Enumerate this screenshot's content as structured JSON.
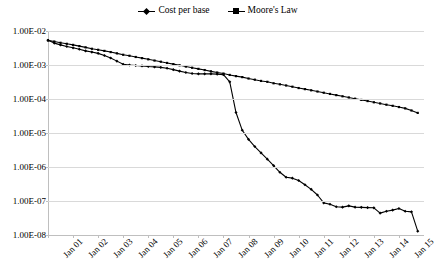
{
  "chart_data": {
    "type": "line",
    "title": "",
    "xlabel": "",
    "ylabel": "",
    "yscale": "log",
    "ylim": [
      1e-08,
      0.01
    ],
    "grid": true,
    "legend_position": "top-center",
    "ytick_labels": [
      "1.00E-02",
      "1.00E-03",
      "1.00E-04",
      "1.00E-05",
      "1.00E-06",
      "1.00E-07",
      "1.00E-08"
    ],
    "ytick_values": [
      0.01,
      0.001,
      0.0001,
      1e-05,
      1e-06,
      1e-07,
      1e-08
    ],
    "categories": [
      "Jan 01",
      "Jan 02",
      "Jan 03",
      "Jan 04",
      "Jan 05",
      "Jan 06",
      "Jan 07",
      "Jan 08",
      "Jan 09",
      "Jan 10",
      "Jan 11",
      "Jan 12",
      "Jan 13",
      "Jan 14",
      "Jan 15"
    ],
    "x": [
      2001.0,
      2002.0,
      2003.0,
      2004.0,
      2005.0,
      2006.0,
      2007.0,
      2008.0,
      2009.0,
      2010.0,
      2011.0,
      2012.0,
      2013.0,
      2014.0,
      2015.0
    ],
    "series": [
      {
        "name": "Cost per base",
        "marker": "diamond",
        "color": "#000000",
        "x": [
          2001.0,
          2001.25,
          2001.5,
          2001.75,
          2002.0,
          2002.25,
          2002.5,
          2002.75,
          2003.0,
          2003.25,
          2003.5,
          2003.75,
          2004.0,
          2004.25,
          2004.5,
          2004.75,
          2005.0,
          2005.25,
          2005.5,
          2005.75,
          2006.0,
          2006.25,
          2006.5,
          2006.75,
          2007.0,
          2007.25,
          2007.5,
          2007.75,
          2008.0,
          2008.25,
          2008.5,
          2008.75,
          2009.0,
          2009.25,
          2009.5,
          2009.75,
          2010.0,
          2010.25,
          2010.5,
          2010.75,
          2011.0,
          2011.25,
          2011.5,
          2011.75,
          2012.0,
          2012.25,
          2012.5,
          2012.75,
          2013.0,
          2013.25,
          2013.5,
          2013.75,
          2014.0,
          2014.25,
          2014.5,
          2014.75,
          2015.0,
          2015.25,
          2015.5,
          2015.75
        ],
        "values": [
          0.0053,
          0.0044,
          0.0039,
          0.0035,
          0.0032,
          0.0029,
          0.0026,
          0.0024,
          0.0022,
          0.0019,
          0.0016,
          0.0013,
          0.00105,
          0.001,
          0.00097,
          0.00094,
          0.0009,
          0.00088,
          0.00085,
          0.0008,
          0.00073,
          0.00066,
          0.0006,
          0.00056,
          0.00055,
          0.00055,
          0.00055,
          0.00054,
          0.00052,
          0.00032,
          4e-05,
          1.2e-05,
          6.5e-06,
          4e-06,
          2.6e-06,
          1.7e-06,
          1.1e-06,
          7e-07,
          5e-07,
          4.7e-07,
          4e-07,
          3e-07,
          2.2e-07,
          1.5e-07,
          8.8e-08,
          8e-08,
          6.8e-08,
          6.6e-08,
          7.2e-08,
          6.6e-08,
          6.5e-08,
          6.4e-08,
          6.3e-08,
          4.4e-08,
          5e-08,
          5.4e-08,
          6e-08,
          5e-08,
          4.8e-08,
          1.3e-08
        ]
      },
      {
        "name": "Moore's Law",
        "marker": "square",
        "color": "#000000",
        "x": [
          2001.0,
          2001.25,
          2001.5,
          2001.75,
          2002.0,
          2002.25,
          2002.5,
          2002.75,
          2003.0,
          2003.25,
          2003.5,
          2003.75,
          2004.0,
          2004.25,
          2004.5,
          2004.75,
          2005.0,
          2005.25,
          2005.5,
          2005.75,
          2006.0,
          2006.25,
          2006.5,
          2006.75,
          2007.0,
          2007.25,
          2007.5,
          2007.75,
          2008.0,
          2008.25,
          2008.5,
          2008.75,
          2009.0,
          2009.25,
          2009.5,
          2009.75,
          2010.0,
          2010.25,
          2010.5,
          2010.75,
          2011.0,
          2011.25,
          2011.5,
          2011.75,
          2012.0,
          2012.25,
          2012.5,
          2012.75,
          2013.0,
          2013.25,
          2013.5,
          2013.75,
          2014.0,
          2014.25,
          2014.5,
          2014.75,
          2015.0,
          2015.25,
          2015.5,
          2015.75
        ],
        "values": [
          0.0053,
          0.0049,
          0.0045,
          0.0042,
          0.0039,
          0.0036,
          0.0033,
          0.003,
          0.0028,
          0.0026,
          0.0024,
          0.0022,
          0.002,
          0.00187,
          0.00172,
          0.00159,
          0.00147,
          0.00135,
          0.00125,
          0.00115,
          0.00106,
          0.00098,
          0.0009,
          0.00083,
          0.00077,
          0.00071,
          0.00065,
          0.0006,
          0.00056,
          0.00051,
          0.00047,
          0.00044,
          0.0004,
          0.00037,
          0.00034,
          0.00032,
          0.00029,
          0.00027,
          0.00025,
          0.00023,
          0.00021,
          0.000195,
          0.00018,
          0.000166,
          0.000153,
          0.000141,
          0.00013,
          0.00012,
          0.000111,
          0.000102,
          9.4e-05,
          8.7e-05,
          8e-05,
          7.4e-05,
          6.8e-05,
          6.3e-05,
          5.8e-05,
          5.3e-05,
          4.6e-05,
          3.9e-05
        ]
      }
    ]
  }
}
